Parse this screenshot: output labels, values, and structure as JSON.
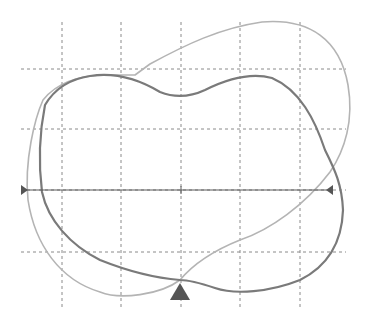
{
  "colors": {
    "background": "#ffffff",
    "grid": "#8a8a8a",
    "curve_light": "#b4b4b4",
    "curve_dark": "#7a7a7a",
    "axis": "#5a5a5a",
    "marker": "#555555"
  },
  "grid": {
    "vertical_x": [
      62,
      121,
      181,
      240,
      300
    ],
    "vertical_y_range": [
      22,
      307
    ],
    "horizontal_y": [
      69,
      129,
      190,
      252
    ],
    "horizontal_x_range": [
      21,
      346
    ]
  },
  "axis": {
    "y": 190,
    "x_start": 21,
    "x_end": 327,
    "center_tick_x": 181,
    "left_marker": "right-pointing-triangle",
    "right_marker": "left-pointing-triangle"
  },
  "bottom_marker": {
    "shape": "up-triangle",
    "x": 180,
    "y_base": 300
  },
  "curves": [
    {
      "name": "light-outline",
      "points": "M 108 75 L 135 75 L 150 64 C 185 45, 220 28, 262 22 C 310 18, 340 40, 348 85 C 354 120, 345 150, 330 172 C 305 205, 270 230, 240 240 C 215 250, 195 262, 180 280 C 160 295, 120 300, 100 292 C 60 280, 35 245, 28 200 C 24 160, 35 118, 43 100 C 55 85, 75 75, 108 75 Z"
    },
    {
      "name": "dark-outline",
      "points": "M 90 76 C 115 72, 140 80, 160 92 C 175 98, 190 97, 205 90 C 225 80, 250 72, 272 78 C 300 90, 315 120, 325 150 C 335 170, 342 185, 343 210 C 342 240, 330 265, 300 280 C 270 292, 235 295, 215 288 C 200 283, 190 280, 180 280 C 155 278, 125 270, 100 260 C 70 245, 48 220, 42 192 C 38 160, 40 130, 45 105 C 55 88, 70 79, 90 76 Z"
    }
  ]
}
